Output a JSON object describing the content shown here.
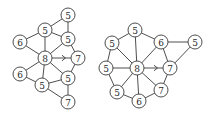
{
  "diagram": {
    "type": "graph-transformation",
    "node_radius": 7,
    "colors": {
      "stroke": "#3a3a3a",
      "fill": "#ffffff",
      "text": "#2a2a2a"
    },
    "graphs": [
      {
        "id": "left",
        "nodes": [
          {
            "id": "a",
            "label": "5",
            "x": 68,
            "y": 15
          },
          {
            "id": "b",
            "label": "5",
            "x": 45,
            "y": 30
          },
          {
            "id": "c",
            "label": "6",
            "x": 20,
            "y": 42
          },
          {
            "id": "d",
            "label": "5",
            "x": 68,
            "y": 39
          },
          {
            "id": "e",
            "label": "8",
            "x": 45,
            "y": 58
          },
          {
            "id": "f",
            "label": "7",
            "x": 78,
            "y": 58
          },
          {
            "id": "g",
            "label": "6",
            "x": 20,
            "y": 74
          },
          {
            "id": "h",
            "label": "5",
            "x": 68,
            "y": 78
          },
          {
            "id": "i",
            "label": "5",
            "x": 42,
            "y": 85
          },
          {
            "id": "j",
            "label": "7",
            "x": 68,
            "y": 102
          }
        ],
        "edges": [
          [
            "a",
            "b"
          ],
          [
            "a",
            "d"
          ],
          [
            "b",
            "c"
          ],
          [
            "b",
            "d"
          ],
          [
            "b",
            "e"
          ],
          [
            "c",
            "e"
          ],
          [
            "d",
            "e"
          ],
          [
            "d",
            "f"
          ],
          [
            "e",
            "g"
          ],
          [
            "e",
            "i"
          ],
          [
            "e",
            "h"
          ],
          [
            "f",
            "h"
          ],
          [
            "g",
            "i"
          ],
          [
            "i",
            "h"
          ],
          [
            "i",
            "j"
          ],
          [
            "h",
            "j"
          ]
        ],
        "arrow": {
          "from": "e",
          "to": "f"
        }
      },
      {
        "id": "right",
        "nodes": [
          {
            "id": "a",
            "label": "5",
            "x": 135,
            "y": 30
          },
          {
            "id": "b",
            "label": "5",
            "x": 112,
            "y": 43
          },
          {
            "id": "c",
            "label": "6",
            "x": 161,
            "y": 42
          },
          {
            "id": "d",
            "label": "5",
            "x": 195,
            "y": 42
          },
          {
            "id": "e",
            "label": "5",
            "x": 106,
            "y": 68
          },
          {
            "id": "f",
            "label": "8",
            "x": 137,
            "y": 68
          },
          {
            "id": "g",
            "label": "7",
            "x": 170,
            "y": 68
          },
          {
            "id": "h",
            "label": "5",
            "x": 117,
            "y": 92
          },
          {
            "id": "i",
            "label": "6",
            "x": 139,
            "y": 101
          },
          {
            "id": "j",
            "label": "7",
            "x": 161,
            "y": 90
          }
        ],
        "edges": [
          [
            "a",
            "b"
          ],
          [
            "a",
            "c"
          ],
          [
            "a",
            "f"
          ],
          [
            "b",
            "f"
          ],
          [
            "b",
            "e"
          ],
          [
            "c",
            "f"
          ],
          [
            "c",
            "d"
          ],
          [
            "c",
            "g"
          ],
          [
            "d",
            "g"
          ],
          [
            "e",
            "f"
          ],
          [
            "e",
            "h"
          ],
          [
            "f",
            "h"
          ],
          [
            "f",
            "i"
          ],
          [
            "f",
            "j"
          ],
          [
            "h",
            "i"
          ],
          [
            "i",
            "j"
          ],
          [
            "j",
            "g"
          ]
        ],
        "arrow": {
          "from": "f",
          "to": "g"
        }
      }
    ]
  }
}
